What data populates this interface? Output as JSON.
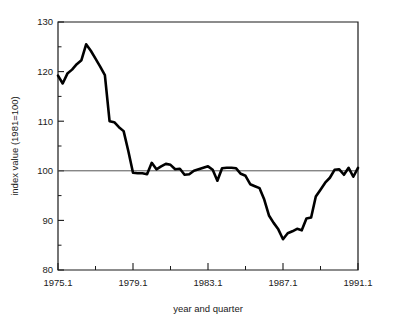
{
  "chart_data": {
    "type": "line",
    "title": "",
    "xlabel": "year and quarter",
    "ylabel": "index value (1981=100)",
    "xlim": [
      1975.1,
      1991.1
    ],
    "ylim": [
      80,
      130
    ],
    "grid": false,
    "legend": "none",
    "reference_line": 100,
    "x_major_ticks": [
      "1975.1",
      "1979.1",
      "1983.1",
      "1987.1",
      "1991.1"
    ],
    "x_major_tick_values": [
      1975.1,
      1979.1,
      1983.1,
      1987.1,
      1991.1
    ],
    "x_minor_tick_values": [
      1977.1,
      1981.1,
      1985.1,
      1989.1
    ],
    "y_major_ticks": [
      "80",
      "90",
      "100",
      "110",
      "120",
      "130"
    ],
    "y_major_tick_values": [
      80,
      90,
      100,
      110,
      120,
      130
    ],
    "y_minor_tick_values": [
      85,
      95,
      105,
      115,
      125
    ],
    "series": [
      {
        "name": "index value",
        "x": [
          1975.1,
          1975.2,
          1975.3,
          1975.4,
          1976.1,
          1976.2,
          1976.3,
          1976.4,
          1977.1,
          1977.2,
          1977.3,
          1977.4,
          1978.1,
          1978.2,
          1978.3,
          1978.4,
          1979.1,
          1979.2,
          1979.3,
          1979.4,
          1980.1,
          1980.2,
          1980.3,
          1980.4,
          1981.1,
          1981.2,
          1981.3,
          1981.4,
          1982.1,
          1982.2,
          1982.3,
          1982.4,
          1983.1,
          1983.2,
          1983.3,
          1983.4,
          1984.1,
          1984.2,
          1984.3,
          1984.4,
          1985.1,
          1985.2,
          1985.3,
          1985.4,
          1986.1,
          1986.2,
          1986.3,
          1986.4,
          1987.1,
          1987.2,
          1987.3,
          1987.4,
          1988.1,
          1988.2,
          1988.3,
          1988.4,
          1989.1,
          1989.2,
          1989.3,
          1989.4,
          1990.1,
          1990.2,
          1990.3,
          1990.4,
          1991.1
        ],
        "values": [
          119.2,
          117.6,
          119.6,
          120.4,
          121.5,
          122.3,
          125.5,
          124.2,
          122.6,
          121.0,
          119.3,
          110.0,
          109.8,
          108.8,
          108.0,
          104.0,
          99.6,
          99.5,
          99.5,
          99.3,
          101.6,
          100.3,
          100.9,
          101.4,
          101.2,
          100.3,
          100.4,
          99.2,
          99.3,
          100.0,
          100.3,
          100.6,
          100.9,
          100.2,
          98.0,
          100.5,
          100.6,
          100.6,
          100.5,
          99.4,
          99.0,
          97.3,
          96.9,
          96.5,
          94.2,
          91.0,
          89.5,
          88.2,
          86.2,
          87.4,
          87.8,
          88.3,
          88.0,
          90.4,
          90.6,
          94.8,
          96.2,
          97.6,
          98.6,
          100.2,
          100.3,
          99.2,
          100.6,
          98.8,
          100.6
        ]
      }
    ]
  }
}
